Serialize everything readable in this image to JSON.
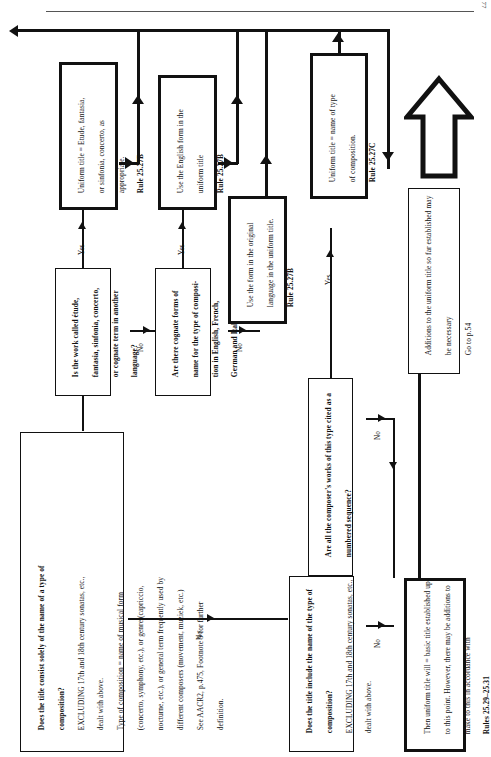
{
  "page": {
    "number": "77"
  },
  "diagram": {
    "orientation": "landscape-rotated-90",
    "nodes": [
      {
        "id": "q-title-consist",
        "type": "decision",
        "text": "Does the title consist solely of the name of a type of composition?\nEXCLUDING 17th and 18th century sonatas, etc., dealt with above.\nType of composition = name of musical form (concerto, symphony, etc.), or genre (capriccio, nocturne, etc.), or general term frequently used by different composers (movement, muziek, etc.)\nSee AACR2, p.475, Footnote 9 for further definition.",
        "bold_lead": "Does the title consist solely of the name of a type of composition?"
      },
      {
        "id": "q-work-called",
        "type": "decision",
        "text": "Is the work called étude, fantasia, sinfonia, concerto, or cognate term in another language?"
      },
      {
        "id": "q-cognate-forms",
        "type": "decision",
        "text": "Are there cognate forms of name for the type of composition in English, French, German and Italian?"
      },
      {
        "id": "a-etude",
        "type": "action",
        "text": "Uniform title = Etude, fantasia, or sinfonia, concerto, as appropriate.\nRule 25.27B",
        "rule": "Rule 25.27B"
      },
      {
        "id": "a-english-form",
        "type": "action",
        "text": "Use the English form in the uniform title\nRule 25.27B",
        "rule": "Rule 25.27B"
      },
      {
        "id": "a-original-lang",
        "type": "action",
        "text": "Use the form in the original language in the uniform title.\nRule 25.27B",
        "rule": "Rule 25.27B"
      },
      {
        "id": "q-numbered-sequence",
        "type": "decision",
        "text": "Are all the composer's works of this type cited as a numbered sequence?"
      },
      {
        "id": "a-name-of-type",
        "type": "action",
        "text": "Uniform title = name of type of composition.\nRule 25.27C",
        "rule": "Rule 25.27C"
      },
      {
        "id": "q-title-include",
        "type": "decision",
        "text": "Does the title include the name of the type of composition?\nEXCLUDING 17th and 18th century sonatas, etc., dealt with above.",
        "bold_lead": "Does the title include the name of the type of composition?"
      },
      {
        "id": "a-basic-title",
        "type": "action",
        "text": "Then uniform title will = basic title established up to this point. However, there may be additions to make to this in accordance with\nRules 25.29–25.31",
        "rule": "Rules 25.29–25.31"
      },
      {
        "id": "a-additions",
        "type": "action",
        "text": "Additions to the uniform title so far established may be necessary\nGo to p.54"
      }
    ],
    "edge_labels": {
      "yes": "Yes",
      "no": "No"
    }
  },
  "text": {
    "q_consist_l1": "Does the title consist solely of the name of a type of",
    "q_consist_l2": "composition?",
    "q_consist_l3": "EXCLUDING 17th and 18th century sonatas, etc.,",
    "q_consist_l4": "dealt with above.",
    "q_consist_l5": "Type of composition = name of musical form",
    "q_consist_l6": "(concerto, symphony, etc.), or genre (capriccio,",
    "q_consist_l7": "nocturne, etc.), or general term frequently used by",
    "q_consist_l8": "different composers (movement, muziek, etc.)",
    "q_consist_l9": "See AACR2, p.475, Footnote 9 for further",
    "q_consist_l10": "definition.",
    "q_called_l1": "Is the work called étude,",
    "q_called_l2": "fantasia, sinfonia, concerto,",
    "q_called_l3": "or cognate term in another",
    "q_called_l4": "language?",
    "q_cognate_l1": "Are there cognate forms of",
    "q_cognate_l2": "name for the type of composi-",
    "q_cognate_l3": "tion in English, French,",
    "q_cognate_l4": "German and Italian?",
    "a_etude_l1": "Uniform title = Etude, fantasia,",
    "a_etude_l2": "or sinfonia, concerto, as",
    "a_etude_l3": "appropriate.",
    "a_etude_l4": "Rule 25.27B",
    "a_english_l1": "Use the English form in the",
    "a_english_l2": "uniform title",
    "a_english_l3": "Rule 25.27B",
    "a_original_l1": "Use the form in the original",
    "a_original_l2": "language in the uniform title.",
    "a_original_l3": "Rule 25.27B",
    "q_numbered_l1": "Are all the composer's works of this type cited as a",
    "q_numbered_l2": "numbered sequence?",
    "a_nametype_l1": "Uniform title = name of type",
    "a_nametype_l2": "of composition.",
    "a_nametype_l3": "Rule 25.27C",
    "q_include_l1": "Does the title include the name of the type of",
    "q_include_l2": "composition?",
    "q_include_l3": "EXCLUDING 17th and 18th century sonatas, etc.,",
    "q_include_l4": "dealt with above.",
    "a_basic_l1": "Then uniform title will = basic title established up",
    "a_basic_l2": "to this point. However, there may be additions to",
    "a_basic_l3": "make to this in accordance with",
    "a_basic_l4": "Rules 25.29–25.31",
    "a_add_l1": "Additions to the uniform title so far established may",
    "a_add_l2": "be necessary",
    "a_add_l3": "Go to p.54",
    "yes": "Yes",
    "no": "No"
  }
}
